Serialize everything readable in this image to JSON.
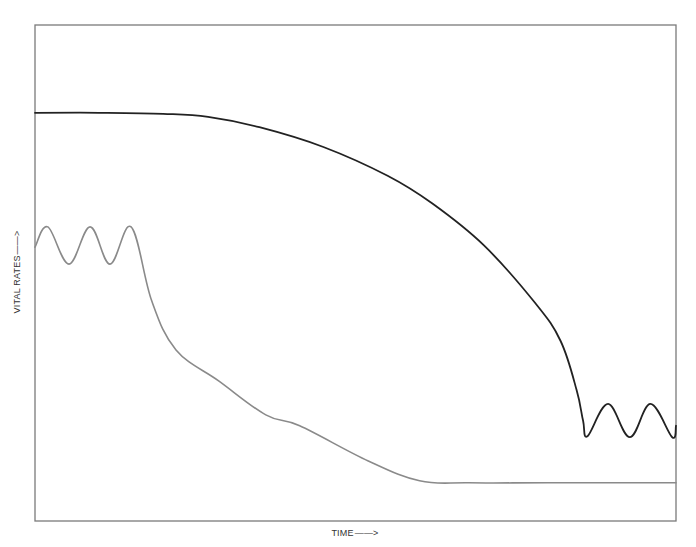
{
  "chart_data": {
    "type": "line",
    "title": "",
    "xlabel": "TIME",
    "ylabel": "VITAL RATES",
    "xlabel_arrow": "——>",
    "ylabel_arrow": "——>",
    "grid": false,
    "legend": null,
    "ticks": {
      "x": [],
      "y": []
    },
    "axis_units": "qualitative (no numeric scale); values normalized 0 (bottom) to 100 (top) of plot frame, x 0 (left) to 100 (right)",
    "xlim": [
      0,
      100
    ],
    "ylim": [
      0,
      100
    ],
    "series": [
      {
        "name": "black-curve",
        "color": "#222222",
        "description": "Starts high and flat, declines slowly then steeply, ends oscillating at a low level",
        "points": [
          [
            0,
            82.3
          ],
          [
            10,
            82.3
          ],
          [
            20,
            82.1
          ],
          [
            27,
            81.5
          ],
          [
            35,
            79.4
          ],
          [
            45,
            75.4
          ],
          [
            55,
            69.6
          ],
          [
            62,
            64.0
          ],
          [
            70,
            55.6
          ],
          [
            78,
            44.0
          ],
          [
            82,
            36.3
          ],
          [
            84.5,
            26.4
          ],
          [
            85.5,
            20.2
          ],
          [
            86.2,
            17.1
          ],
          [
            89.4,
            23.6
          ],
          [
            92.8,
            16.9
          ],
          [
            96.0,
            23.6
          ],
          [
            99.4,
            16.9
          ],
          [
            100,
            19.2
          ]
        ]
      },
      {
        "name": "gray-curve",
        "color": "#8a8a8a",
        "description": "Starts oscillating at a mid level, then declines steeply and levels off low",
        "points": [
          [
            0,
            55.2
          ],
          [
            2.0,
            59.3
          ],
          [
            5.3,
            51.8
          ],
          [
            8.6,
            59.3
          ],
          [
            11.7,
            51.8
          ],
          [
            15.0,
            59.3
          ],
          [
            18.2,
            44.4
          ],
          [
            22,
            34.5
          ],
          [
            28.7,
            28.2
          ],
          [
            36,
            21.4
          ],
          [
            41.3,
            19.2
          ],
          [
            52,
            12.1
          ],
          [
            60,
            8.1
          ],
          [
            67.7,
            7.7
          ],
          [
            80,
            7.7
          ],
          [
            100,
            7.7
          ]
        ]
      }
    ]
  },
  "labels": {
    "x_axis": "TIME",
    "y_axis": "VITAL RATES"
  }
}
